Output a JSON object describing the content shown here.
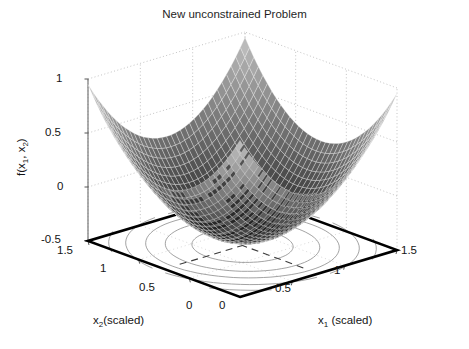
{
  "chart_data": {
    "type": "surface3d",
    "title": "New unconstrained Problem",
    "xlabel": "x_1 (scaled)",
    "ylabel": "x_2(scaled)",
    "zlabel": "f(x_1, x_2)",
    "x1_label_main": "x",
    "x1_label_sub": "1",
    "x1_label_tail": " (scaled)",
    "x2_label_main": "x",
    "x2_label_sub": "2",
    "x2_label_tail": "(scaled)",
    "z_label_main": "f(x",
    "z_label_sub1": "1",
    "z_label_mid": ", x",
    "z_label_sub2": "2",
    "z_label_tail": ")",
    "x1_ticks": [
      "0",
      "0.5",
      "1",
      "1.5"
    ],
    "x2_ticks": [
      "0",
      "0.5",
      "1",
      "1.5"
    ],
    "z_ticks": [
      "-0.5",
      "0",
      "0.5",
      "1"
    ],
    "xlim": [
      0,
      1.5
    ],
    "ylim": [
      0,
      1.5
    ],
    "zlim": [
      -0.5,
      1
    ],
    "grid": true,
    "grid_style": "dotted",
    "surface": {
      "function": "paraboloid",
      "description": "bowl-shaped quadratic surface, mesh wireframe, grayscale shading dark at minimum",
      "minimum_x1": 0.75,
      "minimum_x2": 0.75,
      "minimum_value": -0.45,
      "corner_value": 0.95,
      "mesh_lines_u": 34,
      "mesh_lines_v": 34
    },
    "contour": {
      "shown": true,
      "levels": [
        -0.3,
        -0.1,
        0.1,
        0.35,
        0.6
      ],
      "center_x1": 0.75,
      "center_x2": 0.75,
      "style": "concentric ellipses on base plane"
    },
    "colors": {
      "axis": "#000000",
      "grid": "#b4b4b4",
      "text": "#141414",
      "surface_dark": "#2b2b2b",
      "surface_light": "#c8c8c8",
      "contour": "#8c8c8c",
      "base_border": "#000000",
      "background": "#ffffff"
    }
  },
  "ticks": {
    "z_1": "1",
    "z_05": "0.5",
    "z_0": "0",
    "z_m05": "-0.5",
    "y_15": "1.5",
    "y_1": "1",
    "y_05": "0.5",
    "y_0": "0",
    "x_0": "0",
    "x_05": "0.5",
    "x_1": "1",
    "x_15": "1.5"
  }
}
